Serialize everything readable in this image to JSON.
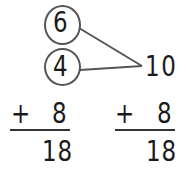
{
  "make_ten": {
    "addend_top": "6",
    "addend_bottom": "4",
    "sum_ten": "10"
  },
  "left_problem": {
    "operator": "+",
    "addend": "8",
    "result": "18"
  },
  "right_problem": {
    "operator": "+",
    "addend": "8",
    "result": "18"
  },
  "colors": {
    "ink": "#1a1a1a",
    "circle_stroke": "#555555",
    "line_stroke": "#555555"
  }
}
